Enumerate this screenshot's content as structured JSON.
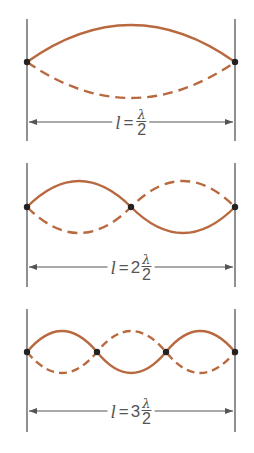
{
  "colors": {
    "wave": "#b8693f",
    "boundary": "#555555",
    "node": "#222222",
    "label": "#555555"
  },
  "panels": [
    {
      "harmonic": 1,
      "label": {
        "var": "l",
        "eq": "=",
        "coef": "",
        "num": "λ",
        "den": "2"
      },
      "label_text": "l = λ/2",
      "nodes_count": 2
    },
    {
      "harmonic": 2,
      "label": {
        "var": "l",
        "eq": "=",
        "coef": "2",
        "num": "λ",
        "den": "2"
      },
      "label_text": "l = 2 λ/2",
      "nodes_count": 3
    },
    {
      "harmonic": 3,
      "label": {
        "var": "l",
        "eq": "=",
        "coef": "3",
        "num": "λ",
        "den": "2"
      },
      "label_text": "l = 3 λ/2",
      "nodes_count": 4
    }
  ]
}
